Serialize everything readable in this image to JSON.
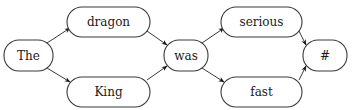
{
  "diagram": {
    "type": "word-lattice",
    "nodes": [
      {
        "id": "the",
        "label": "The",
        "x": 4,
        "y": 40,
        "w": 49,
        "h": 31,
        "rx": 15
      },
      {
        "id": "dragon",
        "label": "dragon",
        "x": 67,
        "y": 7,
        "w": 83,
        "h": 30,
        "rx": 15
      },
      {
        "id": "king",
        "label": "King",
        "x": 67,
        "y": 77,
        "w": 83,
        "h": 30,
        "rx": 15
      },
      {
        "id": "was",
        "label": "was",
        "x": 164,
        "y": 40,
        "w": 44,
        "h": 31,
        "rx": 15
      },
      {
        "id": "serious",
        "label": "serious",
        "x": 221,
        "y": 7,
        "w": 81,
        "h": 30,
        "rx": 15
      },
      {
        "id": "fast",
        "label": "fast",
        "x": 221,
        "y": 77,
        "w": 81,
        "h": 30,
        "rx": 15
      },
      {
        "id": "end",
        "label": "#",
        "x": 303,
        "y": 40,
        "w": 44,
        "h": 31,
        "rx": 15
      }
    ],
    "edges": [
      {
        "from": "the",
        "to": "dragon",
        "x1": 47,
        "y1": 43,
        "x2": 70,
        "y2": 28
      },
      {
        "from": "the",
        "to": "king",
        "x1": 47,
        "y1": 68,
        "x2": 70,
        "y2": 82
      },
      {
        "from": "dragon",
        "to": "was",
        "x1": 147,
        "y1": 31,
        "x2": 167,
        "y2": 45
      },
      {
        "from": "king",
        "to": "was",
        "x1": 147,
        "y1": 80,
        "x2": 167,
        "y2": 66
      },
      {
        "from": "was",
        "to": "serious",
        "x1": 202,
        "y1": 43,
        "x2": 224,
        "y2": 28
      },
      {
        "from": "was",
        "to": "fast",
        "x1": 202,
        "y1": 68,
        "x2": 224,
        "y2": 82
      },
      {
        "from": "serious",
        "to": "end",
        "x1": 299,
        "y1": 31,
        "x2": 306,
        "y2": 45
      },
      {
        "from": "fast",
        "to": "end",
        "x1": 299,
        "y1": 80,
        "x2": 306,
        "y2": 66
      }
    ],
    "colors": {
      "stroke": "#3a3a3a",
      "text": "#1a1a1a",
      "background": "#ffffff"
    }
  }
}
